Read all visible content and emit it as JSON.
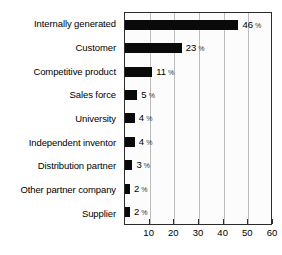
{
  "chart_data": {
    "type": "bar",
    "orientation": "horizontal",
    "title": "",
    "subtitle": "",
    "xlabel": "",
    "ylabel": "",
    "xlim": [
      0,
      60
    ],
    "grid": true,
    "legend": null,
    "value_suffix": "%",
    "xticks": [
      10,
      20,
      30,
      40,
      50,
      60
    ],
    "xtick_labels": [
      "10",
      "20",
      "30",
      "40",
      "50",
      "60"
    ],
    "gridlines_at": [
      10,
      20,
      30,
      40,
      50
    ],
    "categories": [
      "Internally generated",
      "Customer",
      "Competitive product",
      "Sales force",
      "University",
      "Independent inventor",
      "Distribution partner",
      "Other partner company",
      "Supplier"
    ],
    "values": [
      46,
      23,
      11,
      5,
      4,
      4,
      3,
      2,
      2
    ],
    "value_labels": [
      "46",
      "23",
      "11",
      "5",
      "4",
      "4",
      "3",
      "2",
      "2"
    ],
    "percent_sign": "%",
    "colors": {
      "bar": "#0a0a0a",
      "plot_border": "#2b2b2b",
      "gridline": "#bdbdbd",
      "plot_background": "#fcfcfc",
      "text": "#000000",
      "page_background": "#ffffff"
    }
  }
}
